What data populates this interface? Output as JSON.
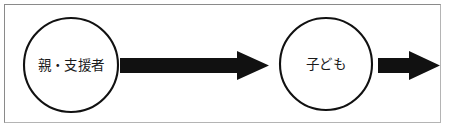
{
  "figure": {
    "kind": "flow-diagram",
    "background_color": "#ffffff",
    "frame_color": "#8a8a8a",
    "ink_color": "#111111",
    "width": 449,
    "height": 134
  },
  "nodes": [
    {
      "id": "parent-supporter",
      "label": "親・支援者",
      "shape": "circle",
      "cx": 71,
      "cy": 65,
      "r": 47,
      "fill": "#ffffff",
      "stroke": "#111111"
    },
    {
      "id": "child",
      "label": "子ども",
      "shape": "circle",
      "cx": 326,
      "cy": 64,
      "r": 46,
      "fill": "#ffffff",
      "stroke": "#111111"
    }
  ],
  "arrows": [
    {
      "id": "parent-to-child",
      "from": "parent-supporter",
      "to": "child",
      "color": "#111111",
      "x_start": 120,
      "x_tip": 269,
      "shaft_top": 58,
      "shaft_bottom": 73,
      "head_top": 51,
      "head_bottom": 80,
      "head_back_x": 237
    },
    {
      "id": "child-outward",
      "from": "child",
      "to": "",
      "color": "#111111",
      "x_start": 378,
      "x_tip": 440,
      "shaft_top": 58,
      "shaft_bottom": 73,
      "head_top": 51,
      "head_bottom": 80,
      "head_back_x": 409
    }
  ]
}
